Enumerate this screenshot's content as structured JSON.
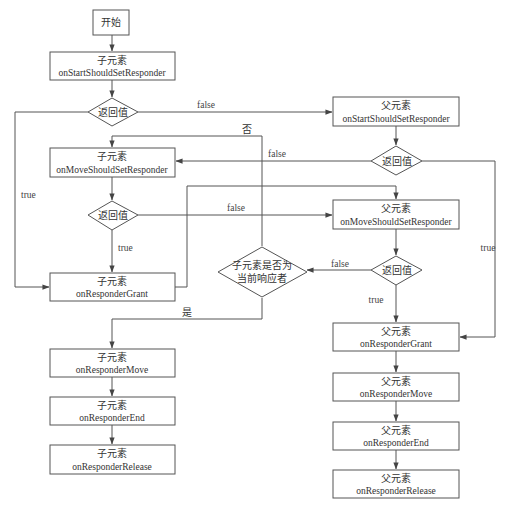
{
  "diagram": {
    "type": "flowchart",
    "nodes": {
      "start": {
        "label": "开始"
      },
      "child_start_should": {
        "owner": "子元素",
        "method": "onStartShouldSetResponder"
      },
      "d1": {
        "label": "返回值"
      },
      "parent_start_should": {
        "owner": "父元素",
        "method": "onStartShouldSetResponder"
      },
      "d2": {
        "label": "返回值"
      },
      "child_move_should": {
        "owner": "子元素",
        "method": "onMoveShouldSetResponder"
      },
      "d3": {
        "label": "返回值"
      },
      "parent_move_should": {
        "owner": "父元素",
        "method": "onMoveShouldSetResponder"
      },
      "d4": {
        "label": "返回值"
      },
      "child_grant": {
        "owner": "子元素",
        "method": "onResponderGrant"
      },
      "is_current": {
        "line1": "子元素是否为",
        "line2": "当前响应者"
      },
      "parent_grant": {
        "owner": "父元素",
        "method": "onResponderGrant"
      },
      "child_move": {
        "owner": "子元素",
        "method": "onResponderMove"
      },
      "child_end": {
        "owner": "子元素",
        "method": "onResponderEnd"
      },
      "child_release": {
        "owner": "子元素",
        "method": "onResponderRelease"
      },
      "parent_move": {
        "owner": "父元素",
        "method": "onResponderMove"
      },
      "parent_end": {
        "owner": "父元素",
        "method": "onResponderEnd"
      },
      "parent_release": {
        "owner": "父元素",
        "method": "onResponderRelease"
      }
    },
    "edge_labels": {
      "d1_false": "false",
      "d1_true": "true",
      "d2_false": "false",
      "d2_true": "true",
      "d3_false": "false",
      "d3_true": "true",
      "d4_false": "false",
      "d4_true": "true",
      "is_current_no": "否",
      "is_current_yes": "是"
    },
    "edges": [
      [
        "start",
        "child_start_should"
      ],
      [
        "child_start_should",
        "d1"
      ],
      [
        "d1",
        "parent_start_should",
        "false"
      ],
      [
        "d1",
        "child_grant",
        "true"
      ],
      [
        "parent_start_should",
        "d2"
      ],
      [
        "d2",
        "child_move_should",
        "false"
      ],
      [
        "d2",
        "parent_grant",
        "true"
      ],
      [
        "child_move_should",
        "d3"
      ],
      [
        "d3",
        "parent_move_should",
        "false"
      ],
      [
        "d3",
        "child_grant",
        "true"
      ],
      [
        "child_grant",
        "parent_move_should"
      ],
      [
        "parent_move_should",
        "d4"
      ],
      [
        "d4",
        "is_current",
        "false"
      ],
      [
        "d4",
        "parent_grant",
        "true"
      ],
      [
        "is_current",
        "child_move_should",
        "否"
      ],
      [
        "is_current",
        "child_move",
        "是"
      ],
      [
        "child_move",
        "child_end"
      ],
      [
        "child_end",
        "child_release"
      ],
      [
        "parent_grant",
        "parent_move"
      ],
      [
        "parent_move",
        "parent_end"
      ],
      [
        "parent_end",
        "parent_release"
      ]
    ]
  }
}
